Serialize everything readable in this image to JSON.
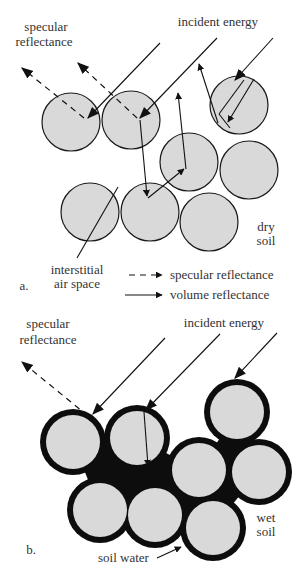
{
  "colors": {
    "particle_fill": "#d9d9d9",
    "outline": "#1a1a1a",
    "water": "#0d0d0d",
    "text": "#333333",
    "background": "#ffffff"
  },
  "panel_a": {
    "label": "a.",
    "specular_label_line1": "specular",
    "specular_label_line2": "reflectance",
    "incident_label": "incident energy",
    "soil_label_line1": "dry",
    "soil_label_line2": "soil",
    "air_label_line1": "interstitial",
    "air_label_line2": "air space",
    "legend": [
      {
        "style": "dashed",
        "label": "specular reflectance"
      },
      {
        "style": "solid",
        "label": "volume reflectance"
      }
    ],
    "particles": [
      {
        "cx": 71,
        "cy": 122,
        "r": 29
      },
      {
        "cx": 131,
        "cy": 120,
        "r": 29
      },
      {
        "cx": 189,
        "cy": 162,
        "r": 29
      },
      {
        "cx": 239,
        "cy": 105,
        "r": 29
      },
      {
        "cx": 249,
        "cy": 170,
        "r": 29
      },
      {
        "cx": 90,
        "cy": 212,
        "r": 29
      },
      {
        "cx": 150,
        "cy": 212,
        "r": 29
      },
      {
        "cx": 209,
        "cy": 222,
        "r": 29
      }
    ]
  },
  "panel_b": {
    "label": "b.",
    "specular_label_line1": "specular",
    "specular_label_line2": "reflectance",
    "incident_label": "incident energy",
    "soil_label_line1": "wet",
    "soil_label_line2": "soil",
    "water_label": "soil water",
    "particles": [
      {
        "cx": 73,
        "cy": 442,
        "r": 28
      },
      {
        "cx": 137,
        "cy": 438,
        "r": 28
      },
      {
        "cx": 199,
        "cy": 470,
        "r": 28
      },
      {
        "cx": 237,
        "cy": 412,
        "r": 28
      },
      {
        "cx": 259,
        "cy": 472,
        "r": 28
      },
      {
        "cx": 100,
        "cy": 510,
        "r": 28
      },
      {
        "cx": 155,
        "cy": 515,
        "r": 28
      },
      {
        "cx": 213,
        "cy": 528,
        "r": 28
      }
    ]
  }
}
